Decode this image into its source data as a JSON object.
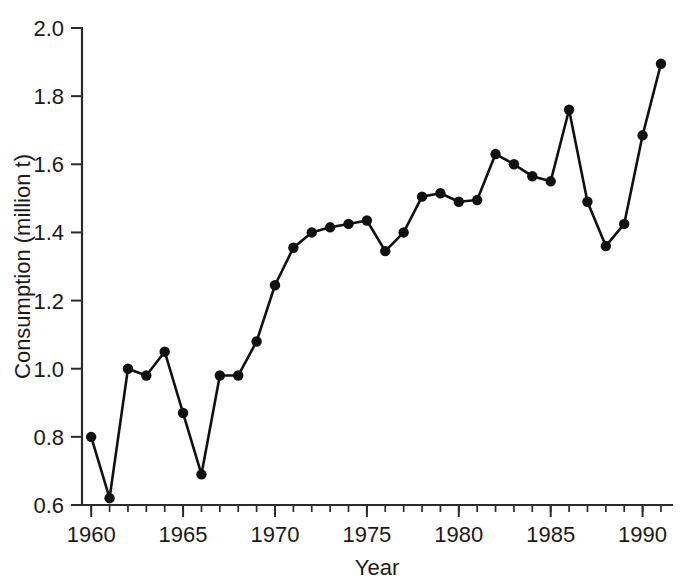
{
  "chart_data": {
    "type": "line",
    "title": "",
    "xlabel": "Year",
    "ylabel": "Consumption (million t)",
    "xlim": [
      1959.5,
      1991.6
    ],
    "ylim": [
      0.6,
      2.0
    ],
    "grid": false,
    "legend": null,
    "x_tick_labels": [
      "1960",
      "1965",
      "1970",
      "1975",
      "1980",
      "1985",
      "1990"
    ],
    "x_tick_values": [
      1960,
      1965,
      1970,
      1975,
      1980,
      1985,
      1990
    ],
    "x_minor_tick_interval": 1,
    "y_tick_labels": [
      "0.6",
      "0.8",
      "1.0",
      "1.2",
      "1.4",
      "1.6",
      "1.8",
      "2.0"
    ],
    "y_tick_values": [
      0.6,
      0.8,
      1.0,
      1.2,
      1.4,
      1.6,
      1.8,
      2.0
    ],
    "marker": "filled-circle",
    "line_color": "#111111",
    "marker_color": "#111111",
    "axis_color": "#2b2b2b",
    "background_color": "#ffffff",
    "x": [
      1960,
      1961,
      1962,
      1963,
      1964,
      1965,
      1966,
      1967,
      1968,
      1969,
      1970,
      1971,
      1972,
      1973,
      1974,
      1975,
      1976,
      1977,
      1978,
      1979,
      1980,
      1981,
      1982,
      1983,
      1984,
      1985,
      1986,
      1987,
      1988,
      1989,
      1990,
      1991
    ],
    "values": [
      0.8,
      0.62,
      1.0,
      0.98,
      1.05,
      0.87,
      0.69,
      0.98,
      0.98,
      1.08,
      1.245,
      1.355,
      1.4,
      1.415,
      1.425,
      1.435,
      1.345,
      1.4,
      1.505,
      1.515,
      1.49,
      1.495,
      1.63,
      1.6,
      1.565,
      1.55,
      1.76,
      1.49,
      1.36,
      1.425,
      1.685,
      1.895
    ],
    "series": [
      {
        "name": "Consumption",
        "values": [
          0.8,
          0.62,
          1.0,
          0.98,
          1.05,
          0.87,
          0.69,
          0.98,
          0.98,
          1.08,
          1.245,
          1.355,
          1.4,
          1.415,
          1.425,
          1.435,
          1.345,
          1.4,
          1.505,
          1.515,
          1.49,
          1.495,
          1.63,
          1.6,
          1.565,
          1.55,
          1.76,
          1.49,
          1.36,
          1.425,
          1.685,
          1.895
        ]
      }
    ]
  }
}
